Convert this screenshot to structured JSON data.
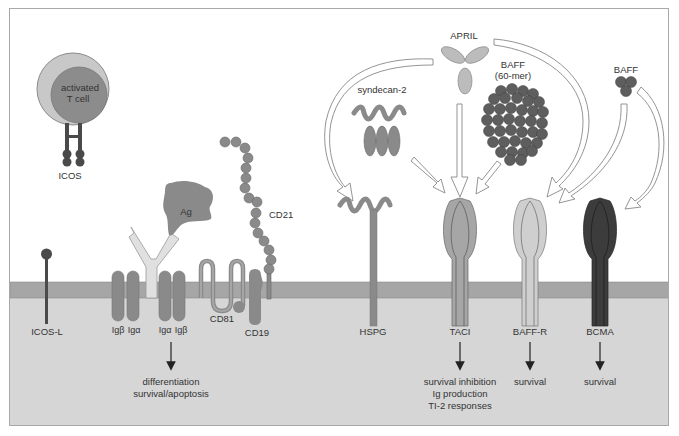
{
  "figure": {
    "colors": {
      "background": "#ffffff",
      "membrane": "#a6a6a6",
      "cytoplasm": "#d6d6d6",
      "frame": "#a8a8a8",
      "mid_gray": "#8a8a8a",
      "light_gray": "#c4c4c4",
      "dark_gray": "#5a5a5a",
      "bcma": "#3c3c3c",
      "arrow_outline": "#888888"
    }
  },
  "t_cell": {
    "label_line1": "activated",
    "label_line2": "T cell",
    "receptor_label": "ICOS"
  },
  "ligands": {
    "antigen": "Ag",
    "april": "APRIL",
    "baff_60mer_line1": "BAFF",
    "baff_60mer_line2": "(60-mer)",
    "baff_trimer": "BAFF",
    "syndecan": "syndecan-2"
  },
  "receptors": {
    "icos_l": "ICOS-L",
    "ig_beta_1": "Igβ",
    "ig_alpha_1": "Igα",
    "ig_alpha_2": "Igα",
    "ig_beta_2": "Igβ",
    "cd81": "CD81",
    "cd19": "CD19",
    "cd21": "CD21",
    "hspg": "HSPG",
    "taci": "TACI",
    "baff_r": "BAFF-R",
    "bcma": "BCMA"
  },
  "outcomes": {
    "bcr_line1": "differentiation",
    "bcr_line2": "survival/apoptosis",
    "taci_line1": "survival inhibition",
    "taci_line2": "Ig production",
    "taci_line3": "TI-2 responses",
    "baff_r": "survival",
    "bcma": "survival"
  }
}
